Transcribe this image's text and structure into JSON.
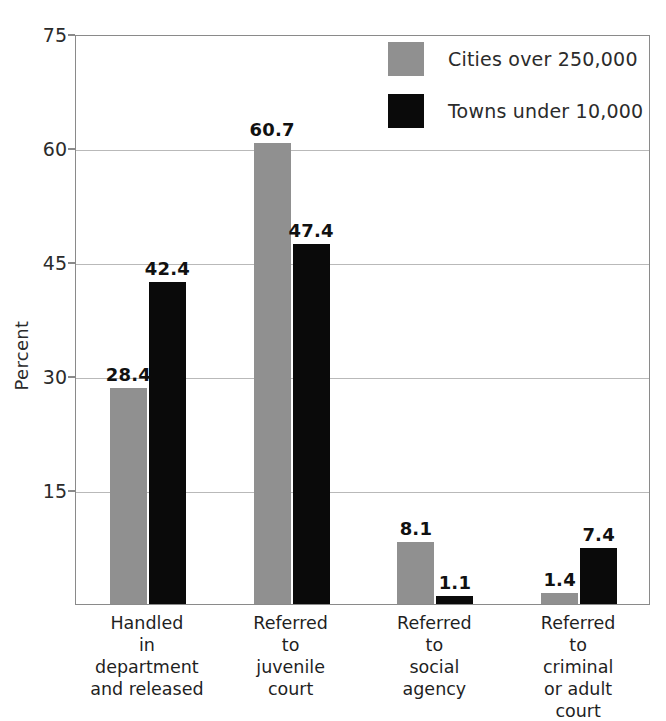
{
  "chart_data": {
    "type": "bar",
    "title": "",
    "subtitle": "",
    "xlabel": "",
    "ylabel": "Percent",
    "ylim": [
      0,
      75
    ],
    "yticks": [
      "75",
      "60",
      "45",
      "30",
      "15"
    ],
    "ytick_values": [
      75,
      60,
      45,
      30,
      15
    ],
    "grid": "horizontal",
    "legend_position": "top-right",
    "categories": [
      "Handled\nin\ndepartment\nand released",
      "Referred\nto\njuvenile\ncourt",
      "Referred\nto\nsocial\nagency",
      "Referred\nto\ncriminal\nor adult\ncourt"
    ],
    "series": [
      {
        "name": "Cities over 250,000",
        "color": "#909090",
        "values": [
          28.4,
          60.7,
          8.1,
          1.4
        ],
        "labels": [
          "28.4",
          "60.7",
          "8.1",
          "1.4"
        ]
      },
      {
        "name": "Towns under 10,000",
        "color": "#0a0a0a",
        "values": [
          42.4,
          47.4,
          1.1,
          7.4
        ],
        "labels": [
          "42.4",
          "47.4",
          "1.1",
          "7.4"
        ]
      }
    ]
  },
  "colors": {
    "series_cities": "#909090",
    "series_towns": "#0a0a0a",
    "axis": "#8a8a8a",
    "grid": "#b9b9b9",
    "background": "#ffffff",
    "text": "#1f1f1f"
  }
}
